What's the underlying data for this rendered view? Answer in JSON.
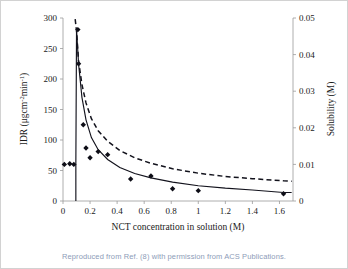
{
  "figure": {
    "background_color": "#ffffff",
    "border_color": "#d2d2d2",
    "caption": "Reproduced from Ref. (8) with permission from ACS Publications.",
    "caption_color": "#8d9cb8"
  },
  "chart_data": {
    "type": "scatter",
    "title": "",
    "xlabel": "NCT concentration in solution (M)",
    "ylabel": "IDR (μgcm⁻²min⁻¹)",
    "y2label": "Solubility (M)",
    "xlim": [
      0,
      1.7
    ],
    "ylim": [
      0,
      300
    ],
    "y2lim": [
      0,
      0.05
    ],
    "grid": false,
    "legend": "none",
    "marker_color": "#0d0d16",
    "line_color": "#12121c",
    "xticks": [
      0,
      0.2,
      0.4,
      0.6,
      0.8,
      1,
      1.2,
      1.4,
      1.6
    ],
    "xtick_labels": [
      "0",
      "0.2",
      "0.4",
      "0.6",
      "0.8",
      "1",
      "1.2",
      "1.4",
      "1.6"
    ],
    "yticks": [
      0,
      50,
      100,
      150,
      200,
      250,
      300
    ],
    "ytick_labels": [
      "0",
      "50",
      "100",
      "150",
      "200",
      "250",
      "300"
    ],
    "y2ticks": [
      0,
      0.01,
      0.02,
      0.03,
      0.04,
      0.05
    ],
    "y2tick_labels": [
      "0",
      "0.01",
      "0.02",
      "0.03",
      "0.04",
      "0.05"
    ],
    "series": [
      {
        "name": "IDR data points",
        "axis": "left",
        "marker": "diamond",
        "style": "markers",
        "points": [
          {
            "x": 0.01,
            "y": 60
          },
          {
            "x": 0.05,
            "y": 61
          },
          {
            "x": 0.08,
            "y": 60
          },
          {
            "x": 0.11,
            "y": 281
          },
          {
            "x": 0.115,
            "y": 225
          },
          {
            "x": 0.15,
            "y": 125
          },
          {
            "x": 0.17,
            "y": 87
          },
          {
            "x": 0.2,
            "y": 71
          },
          {
            "x": 0.26,
            "y": 81
          },
          {
            "x": 0.33,
            "y": 76
          },
          {
            "x": 0.5,
            "y": 36
          },
          {
            "x": 0.65,
            "y": 41
          },
          {
            "x": 0.81,
            "y": 20
          },
          {
            "x": 1.0,
            "y": 17
          },
          {
            "x": 1.63,
            "y": 12
          }
        ]
      },
      {
        "name": "IDR fitted curve",
        "axis": "left",
        "style": "solid-line",
        "points": [
          {
            "x": 0.095,
            "y": 0
          },
          {
            "x": 0.095,
            "y": 60
          },
          {
            "x": 0.1,
            "y": 281
          },
          {
            "x": 0.115,
            "y": 225
          },
          {
            "x": 0.14,
            "y": 170
          },
          {
            "x": 0.17,
            "y": 133
          },
          {
            "x": 0.21,
            "y": 104
          },
          {
            "x": 0.26,
            "y": 84
          },
          {
            "x": 0.33,
            "y": 68
          },
          {
            "x": 0.42,
            "y": 55
          },
          {
            "x": 0.53,
            "y": 45
          },
          {
            "x": 0.65,
            "y": 38
          },
          {
            "x": 0.81,
            "y": 31
          },
          {
            "x": 1.0,
            "y": 25
          },
          {
            "x": 1.2,
            "y": 21
          },
          {
            "x": 1.4,
            "y": 18
          },
          {
            "x": 1.63,
            "y": 14
          },
          {
            "x": 1.69,
            "y": 14
          }
        ]
      },
      {
        "name": "Solubility fitted curve",
        "axis": "right",
        "style": "dashed-line",
        "points": [
          {
            "x": 0.09,
            "y": 0.0497
          },
          {
            "x": 0.1,
            "y": 0.0465
          },
          {
            "x": 0.115,
            "y": 0.0383
          },
          {
            "x": 0.14,
            "y": 0.0318
          },
          {
            "x": 0.17,
            "y": 0.0268
          },
          {
            "x": 0.21,
            "y": 0.0225
          },
          {
            "x": 0.26,
            "y": 0.0192
          },
          {
            "x": 0.33,
            "y": 0.0163
          },
          {
            "x": 0.42,
            "y": 0.0138
          },
          {
            "x": 0.53,
            "y": 0.0118
          },
          {
            "x": 0.65,
            "y": 0.0103
          },
          {
            "x": 0.81,
            "y": 0.0088
          },
          {
            "x": 1.0,
            "y": 0.0076
          },
          {
            "x": 1.2,
            "y": 0.0067
          },
          {
            "x": 1.4,
            "y": 0.0061
          },
          {
            "x": 1.63,
            "y": 0.0055
          },
          {
            "x": 1.69,
            "y": 0.0054
          }
        ]
      }
    ]
  }
}
